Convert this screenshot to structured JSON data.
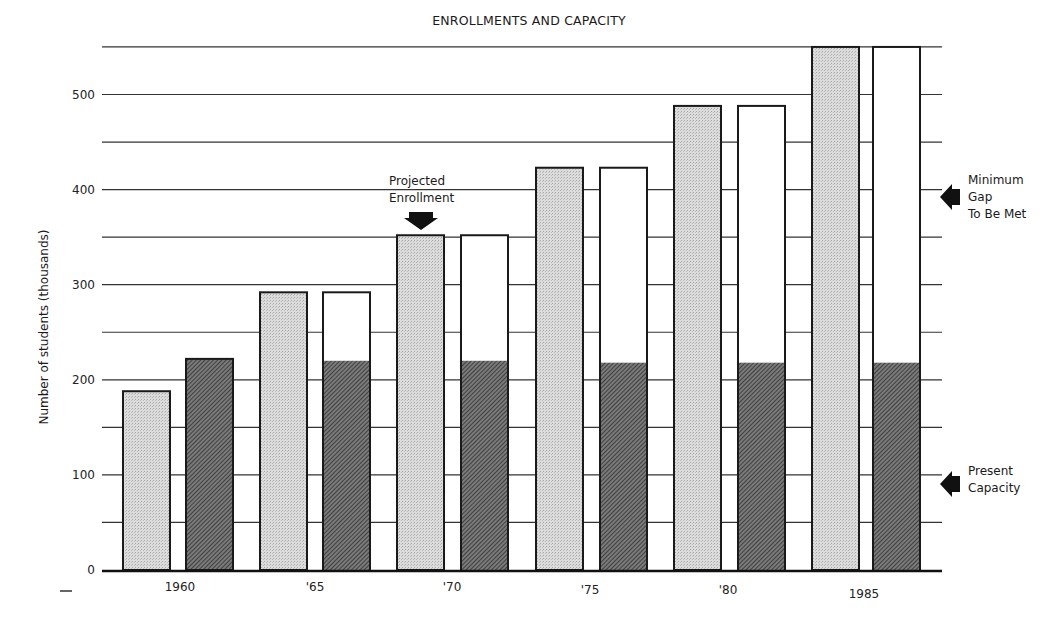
{
  "chart_data": {
    "type": "bar",
    "title": "ENROLLMENTS AND CAPACITY",
    "xlabel": "",
    "ylabel": "Number of students (thousands)",
    "ylim": [
      0,
      550
    ],
    "yticks": [
      0,
      100,
      200,
      300,
      400,
      500
    ],
    "grid": true,
    "categories": [
      "1960",
      "'65",
      "'70",
      "'75",
      "'80",
      "1985"
    ],
    "series": [
      {
        "name": "Projected Enrollment",
        "style": "light stippled",
        "values": [
          188,
          292,
          352,
          423,
          488,
          550
        ]
      },
      {
        "name": "Present Capacity",
        "style": "dark hatched",
        "values": [
          222,
          220,
          220,
          218,
          218,
          218
        ]
      },
      {
        "name": "Minimum Gap To Be Met",
        "style": "white",
        "values": [
          0,
          72,
          132,
          205,
          270,
          332
        ]
      }
    ],
    "annotations": [
      {
        "text": "Projected Enrollment",
        "target": "'70 enrollment bar",
        "arrow": "down"
      },
      {
        "text": "Minimum Gap To Be Met",
        "position": "right",
        "arrow": "left"
      },
      {
        "text": "Present Capacity",
        "position": "right",
        "arrow": "left"
      }
    ],
    "legend_position": "annotations (right side and inline)"
  },
  "labels": {
    "title": "ENROLLMENTS AND CAPACITY",
    "ylabel": "Number of students (thousands)",
    "projected_line1": "Projected",
    "projected_line2": "Enrollment",
    "gap_line1": "Minimum",
    "gap_line2": "Gap",
    "gap_line3": "To Be Met",
    "capacity_line1": "Present",
    "capacity_line2": "Capacity"
  },
  "colors": {
    "enrollment_fill": "#d6d6d6",
    "capacity_fill": "#5a5a5a",
    "gap_fill": "#ffffff",
    "stroke": "#1a1a1a"
  }
}
